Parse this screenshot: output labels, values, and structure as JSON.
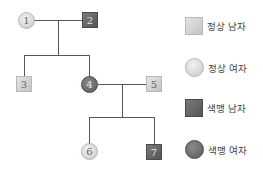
{
  "diagram": {
    "type": "pedigree",
    "nodes": [
      {
        "id": "1",
        "label": "1",
        "sex": "female",
        "status": "normal"
      },
      {
        "id": "2",
        "label": "2",
        "sex": "male",
        "status": "colorblind"
      },
      {
        "id": "3",
        "label": "3",
        "sex": "male",
        "status": "normal"
      },
      {
        "id": "4",
        "label": "4",
        "sex": "female",
        "status": "colorblind"
      },
      {
        "id": "5",
        "label": "5",
        "sex": "male",
        "status": "normal"
      },
      {
        "id": "6",
        "label": "6",
        "sex": "female",
        "status": "normal"
      },
      {
        "id": "7",
        "label": "7",
        "sex": "male",
        "status": "colorblind"
      }
    ],
    "matings": [
      {
        "parents": [
          "1",
          "2"
        ],
        "children": [
          "3",
          "4"
        ]
      },
      {
        "parents": [
          "4",
          "5"
        ],
        "children": [
          "6",
          "7"
        ]
      }
    ]
  },
  "legend": {
    "items": [
      {
        "symbol": "square",
        "status": "normal",
        "label": "정상 남자"
      },
      {
        "symbol": "circle",
        "status": "normal",
        "label": "정상 여자"
      },
      {
        "symbol": "square",
        "status": "affected",
        "label": "색맹 남자"
      },
      {
        "symbol": "circle",
        "status": "affected",
        "label": "색맹 여자"
      }
    ]
  },
  "colors": {
    "normal": "#d4d4d4",
    "affected": "#666666",
    "line": "#555555"
  }
}
